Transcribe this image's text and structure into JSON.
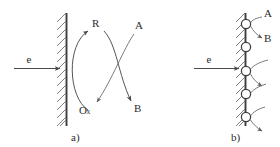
{
  "figure": {
    "background_color": "#ffffff",
    "ink_color": "#4a4a4a",
    "width": 280,
    "height": 147
  },
  "panel_a": {
    "caption": "a)",
    "electron_label": "e",
    "electrode_name": "hatched-electrode-wall",
    "species": {
      "reduced": "R",
      "oxidized_prefix": "O",
      "oxidized_suffix": "x",
      "oxidized": "Ox",
      "substrate": "A",
      "product": "B"
    },
    "arrows": {
      "electron_transfer": "e",
      "cycle_up_label": "R",
      "cycle_down_label": "Ox",
      "substrate_in": "A",
      "product_out": "B"
    }
  },
  "panel_b": {
    "caption": "b)",
    "electron_label": "e",
    "electrode_name": "hatched-electrode-wall",
    "species": {
      "substrate": "A",
      "product": "B"
    },
    "site_count": 5,
    "sites": [
      {
        "index": 1
      },
      {
        "index": 2
      },
      {
        "index": 3
      },
      {
        "index": 4
      },
      {
        "index": 5
      }
    ]
  }
}
